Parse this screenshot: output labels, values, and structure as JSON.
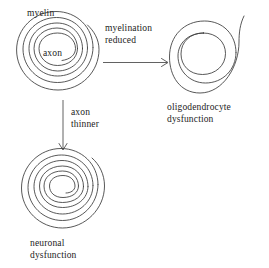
{
  "figure": {
    "background_color": "#ffffff",
    "line_color": "#3a3a3a",
    "text_color": "#1c1c1c"
  },
  "labels": {
    "myelin": "myelin",
    "axon": "axon",
    "myelination_reduced_line1": "myelination",
    "myelination_reduced_line2": "reduced",
    "axon_thinner_line1": "axon",
    "axon_thinner_line2": "thinner",
    "oligodendrocyte_line1": "oligodendrocyte",
    "oligodendrocyte_line2": "dysfunction",
    "neuronal_line1": "neuronal",
    "neuronal_line2": "dysfunction"
  },
  "nodes": [
    {
      "id": "normal-axon",
      "name": "normal myelinated axon",
      "shape": "spiral",
      "center": [
        58,
        55
      ],
      "outer_radius": 42,
      "inner_radius": 17,
      "turns": 4.5,
      "inner_label": "axon",
      "outer_label": "myelin"
    },
    {
      "id": "oligodendrocyte-dysfunction",
      "name": "demyelinated axon",
      "shape": "spiral",
      "center": [
        205,
        57
      ],
      "outer_radius": 36,
      "inner_radius": 18,
      "turns": 2.0,
      "caption": "oligodendrocyte dysfunction"
    },
    {
      "id": "neuronal-dysfunction",
      "name": "thinned axon with myelin",
      "shape": "spiral",
      "center": [
        63,
        192
      ],
      "outer_radius": 42,
      "inner_radius": 9,
      "turns": 5.0,
      "caption": "neuronal dysfunction"
    }
  ],
  "arrows": [
    {
      "id": "arrow-myelination-reduced",
      "from": "normal-axon",
      "to": "oligodendrocyte-dysfunction",
      "direction": "right",
      "label": "myelination reduced"
    },
    {
      "id": "arrow-axon-thinner",
      "from": "normal-axon",
      "to": "neuronal-dysfunction",
      "direction": "down",
      "label": "axon thinner"
    }
  ]
}
